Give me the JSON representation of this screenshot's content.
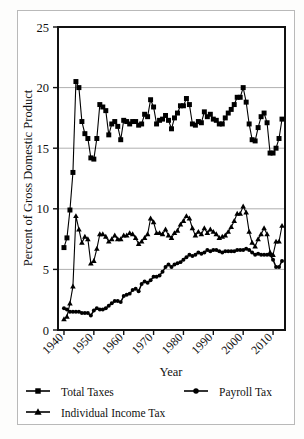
{
  "chart_data": {
    "type": "line",
    "title": "",
    "xlabel": "Year",
    "ylabel": "Percent of Gross Domestic Product",
    "xlim": [
      1938,
      2014
    ],
    "ylim": [
      0,
      25
    ],
    "yticks": [
      0,
      5,
      10,
      15,
      20,
      25
    ],
    "ytick_labels": [
      "0",
      "5",
      "10",
      "15",
      "20",
      "25"
    ],
    "xticks": [
      1940,
      1950,
      1960,
      1970,
      1980,
      1990,
      2000,
      2010
    ],
    "xtick_labels": [
      "1940",
      "1950",
      "1960",
      "1970",
      "1980",
      "1990",
      "2000",
      "2010"
    ],
    "grid": "horizontal",
    "legend_position": "below-axes",
    "x": [
      1940,
      1941,
      1942,
      1943,
      1944,
      1945,
      1946,
      1947,
      1948,
      1949,
      1950,
      1951,
      1952,
      1953,
      1954,
      1955,
      1956,
      1957,
      1958,
      1959,
      1960,
      1961,
      1962,
      1963,
      1964,
      1965,
      1966,
      1967,
      1968,
      1969,
      1970,
      1971,
      1972,
      1973,
      1974,
      1975,
      1976,
      1977,
      1978,
      1979,
      1980,
      1981,
      1982,
      1983,
      1984,
      1985,
      1986,
      1987,
      1988,
      1989,
      1990,
      1991,
      1992,
      1993,
      1994,
      1995,
      1996,
      1997,
      1998,
      1999,
      2000,
      2001,
      2002,
      2003,
      2004,
      2005,
      2006,
      2007,
      2008,
      2009,
      2010,
      2011,
      2012,
      2013
    ],
    "series": [
      {
        "name": "Total Taxes",
        "marker": "square",
        "values": [
          6.8,
          7.6,
          9.9,
          13.0,
          20.5,
          20.0,
          17.2,
          16.2,
          15.8,
          14.2,
          14.1,
          15.8,
          18.6,
          18.4,
          18.1,
          16.1,
          17.0,
          17.2,
          16.8,
          15.7,
          17.3,
          17.2,
          17.0,
          17.2,
          17.2,
          16.9,
          17.0,
          17.8,
          17.6,
          19.0,
          18.4,
          17.0,
          17.3,
          17.4,
          17.7,
          17.3,
          16.6,
          17.5,
          17.9,
          18.5,
          18.5,
          19.1,
          18.6,
          17.0,
          16.9,
          17.2,
          17.1,
          18.0,
          17.6,
          17.8,
          17.4,
          17.3,
          17.0,
          17.0,
          17.5,
          17.9,
          18.2,
          18.6,
          19.2,
          19.2,
          20.0,
          18.8,
          17.0,
          15.7,
          15.6,
          16.7,
          17.6,
          17.9,
          17.1,
          14.6,
          14.6,
          15.0,
          15.8,
          17.4
        ]
      },
      {
        "name": "Payroll Tax",
        "marker": "circle",
        "values": [
          1.8,
          1.7,
          1.5,
          1.5,
          1.5,
          1.5,
          1.4,
          1.4,
          1.4,
          1.2,
          1.6,
          1.8,
          1.7,
          1.7,
          1.8,
          2.0,
          2.2,
          2.4,
          2.4,
          2.3,
          2.8,
          2.9,
          3.0,
          3.3,
          3.4,
          3.2,
          3.8,
          4.0,
          3.9,
          4.1,
          4.4,
          4.4,
          4.5,
          4.8,
          5.2,
          5.4,
          5.2,
          5.4,
          5.5,
          5.6,
          5.8,
          6.0,
          6.2,
          6.1,
          6.2,
          6.4,
          6.3,
          6.4,
          6.6,
          6.5,
          6.6,
          6.6,
          6.5,
          6.4,
          6.5,
          6.5,
          6.5,
          6.5,
          6.6,
          6.6,
          6.6,
          6.7,
          6.6,
          6.4,
          6.2,
          6.3,
          6.2,
          6.2,
          6.2,
          6.2,
          5.8,
          5.2,
          5.2,
          5.7
        ]
      },
      {
        "name": "Individual Income Tax",
        "marker": "triangle",
        "values": [
          0.9,
          1.1,
          2.2,
          3.6,
          9.4,
          8.3,
          7.2,
          7.7,
          7.5,
          5.5,
          5.7,
          6.7,
          7.9,
          7.9,
          7.7,
          7.3,
          7.5,
          7.8,
          7.5,
          7.5,
          7.8,
          7.8,
          8.0,
          7.9,
          7.6,
          7.1,
          7.3,
          7.6,
          7.9,
          9.2,
          8.9,
          8.0,
          8.0,
          7.9,
          8.3,
          7.8,
          7.6,
          8.0,
          8.2,
          8.7,
          9.0,
          9.4,
          9.2,
          8.4,
          7.8,
          8.1,
          7.9,
          8.4,
          8.0,
          8.3,
          8.1,
          7.9,
          7.6,
          7.7,
          7.8,
          8.1,
          8.5,
          9.0,
          9.6,
          9.6,
          10.2,
          9.7,
          8.1,
          7.2,
          6.9,
          7.5,
          7.9,
          8.4,
          7.9,
          6.4,
          6.2,
          7.3,
          7.3,
          8.6
        ]
      }
    ]
  },
  "legend": {
    "items": [
      {
        "label": "Total Taxes",
        "marker": "square"
      },
      {
        "label": "Payroll Tax",
        "marker": "circle"
      },
      {
        "label": "Individual Income Tax",
        "marker": "triangle"
      }
    ]
  }
}
